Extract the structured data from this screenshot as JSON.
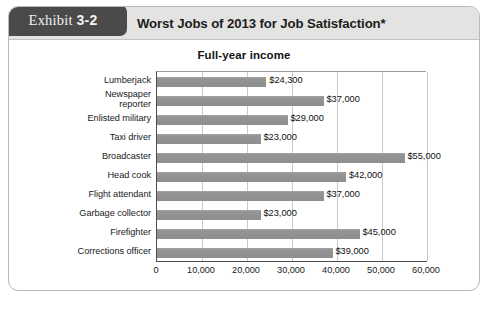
{
  "exhibit": {
    "word": "Exhibit",
    "number": "3-2"
  },
  "header": {
    "title": "Worst Jobs of 2013 for Job Satisfaction*"
  },
  "chart_data": {
    "type": "bar",
    "orientation": "horizontal",
    "title": "Full-year income",
    "xlabel": "",
    "ylabel": "",
    "xlim": [
      0,
      60000
    ],
    "grid": true,
    "legend": false,
    "categories": [
      "Lumberjack",
      "Newspaper\nreporter",
      "Enlisted military",
      "Taxi driver",
      "Broadcaster",
      "Head cook",
      "Flight attendant",
      "Garbage collector",
      "Firefighter",
      "Corrections officer"
    ],
    "values": [
      24300,
      37000,
      29000,
      23000,
      55000,
      42000,
      37000,
      23000,
      45000,
      39000
    ],
    "value_labels": [
      "$24,300",
      "$37,000",
      "$29,000",
      "$23,000",
      "$55,000",
      "$42,000",
      "$37,000",
      "$23,000",
      "$45,000",
      "$39,000"
    ],
    "xticks": [
      0,
      10000,
      20000,
      30000,
      40000,
      50000,
      60000
    ],
    "xtick_labels": [
      "0",
      "10,000",
      "20,000",
      "30,000",
      "40,000",
      "50,000",
      "60,000"
    ],
    "bar_color": "#909090"
  }
}
